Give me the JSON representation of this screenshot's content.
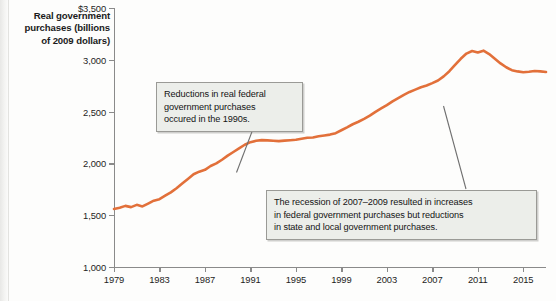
{
  "chart_data": {
    "type": "line",
    "title": "Real government purchases (billions of 2009 dollars)",
    "xlabel": "",
    "ylabel": "Real government purchases (billions of 2009 dollars)",
    "xlim": [
      1979,
      2017
    ],
    "ylim": [
      1000,
      3500
    ],
    "grid": false,
    "legend": null,
    "line_color": "#E2703A",
    "y_ticks": [
      "$3,500",
      "3,000",
      "2,500",
      "2,000",
      "1,500",
      "1,000"
    ],
    "y_tick_values": [
      3500,
      3000,
      2500,
      2000,
      1500,
      1000
    ],
    "x_ticks": [
      "1979",
      "1983",
      "1987",
      "1991",
      "1995",
      "1999",
      "2003",
      "2007",
      "2011",
      "2015"
    ],
    "x_tick_values": [
      1979,
      1983,
      1987,
      1991,
      1995,
      1999,
      2003,
      2007,
      2011,
      2015
    ],
    "series": [
      {
        "name": "Real government purchases",
        "x": [
          1979.0,
          1979.5,
          1980.0,
          1980.5,
          1981.0,
          1981.5,
          1982.0,
          1982.5,
          1983.0,
          1983.5,
          1984.0,
          1984.5,
          1985.0,
          1985.5,
          1986.0,
          1986.5,
          1987.0,
          1987.5,
          1988.0,
          1988.5,
          1989.0,
          1989.5,
          1990.0,
          1990.5,
          1991.0,
          1991.5,
          1992.0,
          1992.5,
          1993.0,
          1993.5,
          1994.0,
          1994.5,
          1995.0,
          1995.5,
          1996.0,
          1996.5,
          1997.0,
          1997.5,
          1998.0,
          1998.5,
          1999.0,
          1999.5,
          2000.0,
          2000.5,
          2001.0,
          2001.5,
          2002.0,
          2002.5,
          2003.0,
          2003.5,
          2004.0,
          2004.5,
          2005.0,
          2005.5,
          2006.0,
          2006.5,
          2007.0,
          2007.5,
          2008.0,
          2008.5,
          2009.0,
          2009.5,
          2010.0,
          2010.5,
          2011.0,
          2011.5,
          2012.0,
          2012.5,
          2013.0,
          2013.5,
          2014.0,
          2014.5,
          2015.0,
          2015.5,
          2016.0,
          2016.5,
          2017.0
        ],
        "values": [
          1560,
          1572,
          1590,
          1578,
          1600,
          1585,
          1612,
          1640,
          1655,
          1688,
          1720,
          1760,
          1805,
          1850,
          1895,
          1920,
          1938,
          1975,
          2000,
          2035,
          2075,
          2110,
          2145,
          2180,
          2205,
          2218,
          2225,
          2222,
          2218,
          2215,
          2220,
          2224,
          2228,
          2238,
          2248,
          2250,
          2262,
          2270,
          2278,
          2292,
          2320,
          2348,
          2378,
          2402,
          2430,
          2462,
          2498,
          2530,
          2562,
          2598,
          2630,
          2662,
          2690,
          2712,
          2735,
          2752,
          2775,
          2800,
          2840,
          2890,
          2950,
          3010,
          3060,
          3085,
          3070,
          3088,
          3055,
          3010,
          2965,
          2928,
          2900,
          2888,
          2880,
          2885,
          2892,
          2888,
          2882
        ]
      }
    ],
    "annotations": [
      {
        "id": "annotation-1990s",
        "text": "Reductions in real federal government purchases occured in the 1990s.",
        "lines": [
          "Reductions in real federal",
          "government purchases",
          "occured in the 1990s."
        ],
        "points_to_year": 1993
      },
      {
        "id": "annotation-recession",
        "text": "The recession of 2007–2009 resulted in increases in federal government purchases but reductions in state and local government purchases.",
        "lines": [
          "The recession of 2007–2009 resulted in increases",
          "in federal government purchases but reductions",
          "in state and local government purchases."
        ],
        "points_to_year": 2010
      }
    ]
  }
}
